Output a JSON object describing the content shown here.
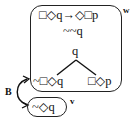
{
  "worlds": {
    "w": {
      "label": "w",
      "formulas": {
        "top": "□◇q→◇□p",
        "second": "~~q",
        "root": "q",
        "left_branch": "~□◇q",
        "right_branch": "□◇p"
      }
    },
    "v": {
      "label": "v",
      "formulas": {
        "main": "~◇q"
      }
    }
  },
  "relation": {
    "label": "B"
  }
}
